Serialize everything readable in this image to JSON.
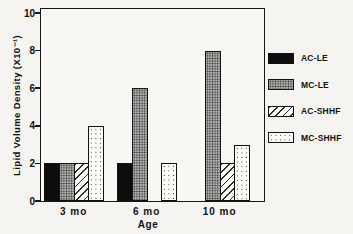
{
  "chart_data": {
    "type": "bar",
    "title": "",
    "xlabel": "Age",
    "ylabel": "Lipid Volume Density (X10⁻¹)",
    "ylim": [
      0,
      10
    ],
    "yticks": [
      0,
      2,
      4,
      6,
      8,
      10
    ],
    "categories": [
      "3 mo",
      "6 mo",
      "10 mo"
    ],
    "series": [
      {
        "name": "AC-LE",
        "pattern": "solid-black",
        "color": "#0d0d0d",
        "values": [
          2,
          2,
          0
        ]
      },
      {
        "name": "MC-LE",
        "pattern": "gray-stipple",
        "color": "#b4b4b2",
        "values": [
          2,
          6,
          8
        ]
      },
      {
        "name": "AC-SHHF",
        "pattern": "diagonal-hatch",
        "color": "#fcfbf8",
        "values": [
          2,
          0,
          2
        ]
      },
      {
        "name": "MC-SHHF",
        "pattern": "sparse-dots",
        "color": "#fcfbf8",
        "values": [
          4,
          2,
          3
        ]
      }
    ],
    "legend_position": "right",
    "grid": "off"
  }
}
